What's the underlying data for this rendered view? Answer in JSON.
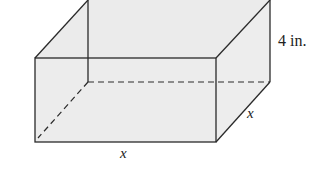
{
  "diagram": {
    "type": "rectangular-box",
    "labels": {
      "height": "4 in.",
      "width": "x",
      "depth": "x"
    },
    "colors": {
      "fill": "#ececec",
      "stroke": "#2a2a2a"
    }
  }
}
